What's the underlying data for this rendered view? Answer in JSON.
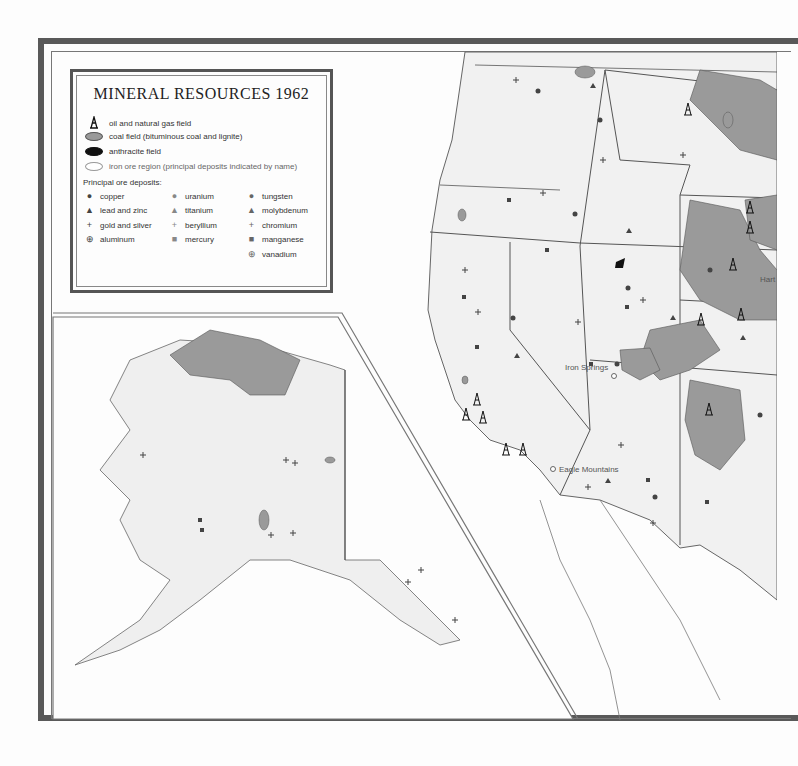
{
  "legend": {
    "title": "MINERAL RESOURCES 1962",
    "fields": [
      {
        "symbol": "oil-derrick",
        "label": "oil and natural gas field"
      },
      {
        "symbol": "gray-ellipse",
        "label": "coal field (bituminous coal and lignite)"
      },
      {
        "symbol": "black-ellipse",
        "label": "anthracite field"
      },
      {
        "symbol": "white-ellipse",
        "label": "iron ore region (principal deposits indicated by name)"
      }
    ],
    "ore_heading": "Principal ore deposits:",
    "ores": [
      {
        "symbol": "●",
        "shade": "dark",
        "label": "copper"
      },
      {
        "symbol": "▲",
        "shade": "dark",
        "label": "lead and zinc"
      },
      {
        "symbol": "+",
        "shade": "dark",
        "label": "gold and silver"
      },
      {
        "symbol": "⊕",
        "shade": "dark",
        "label": "aluminum"
      },
      {
        "symbol": "●",
        "shade": "light",
        "label": "uranium"
      },
      {
        "symbol": "▲",
        "shade": "light",
        "label": "titanium"
      },
      {
        "symbol": "+",
        "shade": "light",
        "label": "beryllium"
      },
      {
        "symbol": "■",
        "shade": "light",
        "label": "mercury"
      },
      {
        "symbol": "●",
        "shade": "mid",
        "label": "tungsten"
      },
      {
        "symbol": "▲",
        "shade": "mid",
        "label": "molybdenum"
      },
      {
        "symbol": "+",
        "shade": "mid",
        "label": "chromium"
      },
      {
        "symbol": "■",
        "shade": "mid",
        "label": "manganese"
      },
      {
        "symbol": "⊕",
        "shade": "mid",
        "label": "vanadium"
      }
    ]
  },
  "places": {
    "iron_springs": "Iron Springs",
    "eagle_mountains": "Eagle Mountains",
    "hartville": "Hart"
  },
  "colors": {
    "frame": "#595959",
    "coal": "#9a9a9a",
    "land": "#efefef",
    "boundary": "#555555"
  }
}
